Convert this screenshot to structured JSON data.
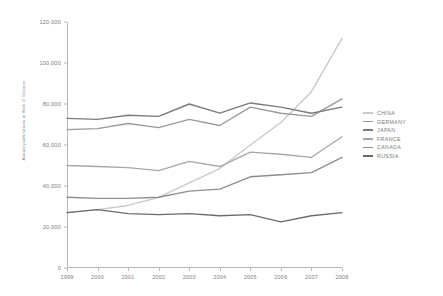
{
  "chart_data": {
    "type": "line",
    "title": "",
    "xlabel": "",
    "ylabel": "Annual publications in Web of Science",
    "x": [
      1999,
      2000,
      2001,
      2002,
      2003,
      2004,
      2005,
      2006,
      2007,
      2008
    ],
    "xtick_labels": [
      "1999",
      "2000",
      "2001",
      "2002",
      "2003",
      "2004",
      "2005",
      "2006",
      "2007",
      "2008"
    ],
    "ytick_labels": [
      "0",
      "20,000",
      "40,000",
      "60,000",
      "80,000",
      "100,000",
      "120,000"
    ],
    "ytick_values": [
      0,
      20000,
      40000,
      60000,
      80000,
      100000,
      120000
    ],
    "ylim": [
      0,
      120000
    ],
    "xlim": [
      1999,
      2008
    ],
    "grid": false,
    "legend_position": "right",
    "series": [
      {
        "name": "CHINA",
        "color": "#c9c9c9",
        "values": [
          27000,
          28500,
          30500,
          34500,
          41500,
          48500,
          60000,
          71000,
          86000,
          112000
        ]
      },
      {
        "name": "GERMANY",
        "color": "#9a9a9a",
        "values": [
          67500,
          68000,
          70500,
          68500,
          72500,
          69500,
          78500,
          75500,
          74000,
          82500
        ]
      },
      {
        "name": "JAPAN",
        "color": "#7b7b7b",
        "values": [
          73000,
          72500,
          74500,
          74000,
          80000,
          75500,
          80500,
          78500,
          75500,
          78500
        ]
      },
      {
        "name": "FRANCE",
        "color": "#a8a8a8",
        "values": [
          50000,
          49500,
          49000,
          47500,
          52000,
          49500,
          56500,
          55500,
          54000,
          64000
        ]
      },
      {
        "name": "CANADA",
        "color": "#8e8e8e",
        "values": [
          34500,
          34000,
          34000,
          34500,
          37500,
          38500,
          44500,
          45500,
          46500,
          54000
        ]
      },
      {
        "name": "RUSSIA",
        "color": "#6b6b6b",
        "values": [
          27000,
          28500,
          26500,
          26000,
          26500,
          25500,
          26000,
          22500,
          25500,
          27000
        ]
      }
    ]
  },
  "legend": {
    "items": [
      {
        "label": "CHINA"
      },
      {
        "label": "GERMANY"
      },
      {
        "label": "JAPAN"
      },
      {
        "label": "FRANCE"
      },
      {
        "label": "CANADA"
      },
      {
        "label": "RUSSIA"
      }
    ]
  },
  "axes": {
    "y_title": "Annual publications in Web of Science"
  }
}
